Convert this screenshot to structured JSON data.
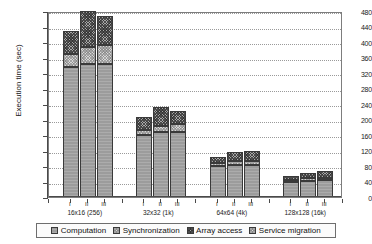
{
  "chart_data": {
    "type": "bar",
    "subtype": "stacked-grouped",
    "title": "",
    "xlabel": "",
    "ylabel": "Execution time (sec)",
    "ylim": [
      0,
      480
    ],
    "ytick_step": 40,
    "yticks": [
      0,
      40,
      80,
      120,
      160,
      200,
      240,
      280,
      320,
      360,
      400,
      440,
      480
    ],
    "grid": true,
    "legend_position": "bottom",
    "categories": [
      "16x16 (256)",
      "32x32 (1k)",
      "64x64 (4k)",
      "128x128 (16k)"
    ],
    "bar_labels": [
      "I",
      "II",
      "III"
    ],
    "series": [
      {
        "name": "Computation",
        "color": "#9c9c9c",
        "values": [
          [
            336,
            344,
            344
          ],
          [
            160,
            168,
            168
          ],
          [
            80,
            83,
            83
          ],
          [
            40,
            42,
            43
          ]
        ]
      },
      {
        "name": "Synchronization",
        "color": "#d8d8d8",
        "values": [
          [
            32,
            44,
            48
          ],
          [
            14,
            16,
            20
          ],
          [
            8,
            10,
            10
          ],
          [
            5,
            6,
            6
          ]
        ]
      },
      {
        "name": "Array access",
        "color": "#a8a8a8",
        "values": [
          [
            60,
            92,
            76
          ],
          [
            32,
            49,
            34
          ],
          [
            15,
            22,
            25
          ],
          [
            9,
            14,
            17
          ]
        ]
      },
      {
        "name": "Service migration",
        "color": "#dcdcdc",
        "values": [
          [
            0,
            0,
            0
          ],
          [
            0,
            0,
            0
          ],
          [
            0,
            0,
            0
          ],
          [
            0,
            0,
            0
          ]
        ]
      }
    ],
    "totals": [
      [
        428,
        480,
        468
      ],
      [
        206,
        233,
        222
      ],
      [
        103,
        115,
        118
      ],
      [
        54,
        62,
        66
      ]
    ]
  },
  "legend": {
    "items": [
      {
        "label": "Computation",
        "swatch": "computation-swatch"
      },
      {
        "label": "Synchronization",
        "swatch": "synchronization-swatch"
      },
      {
        "label": "Array access",
        "swatch": "array-access-swatch"
      },
      {
        "label": "Service migration",
        "swatch": "service-migration-swatch"
      }
    ]
  },
  "axis": {
    "y_title": "Execution time (sec)"
  }
}
